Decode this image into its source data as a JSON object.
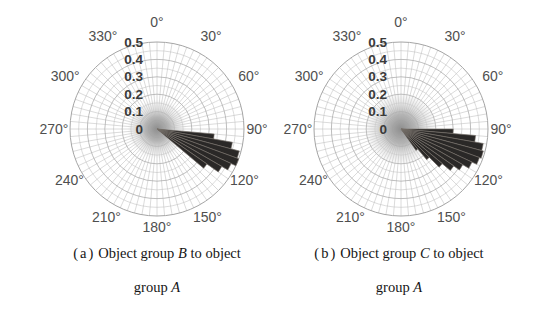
{
  "style": {
    "background": "#ffffff",
    "grid_color_minor": "#bfbfbf",
    "grid_color_major": "#adadad",
    "outer_ring_color": "#a5a5a5",
    "spoke_color": "#bdbdbd",
    "petal_fill": "#2a2827",
    "petal_stroke": "#7a746d",
    "blob_core_color": "#8d8d8d",
    "blob_mid_color": "#a8a8a8",
    "blob_edge_color": "#cfcfcf",
    "angle_label_color": "#4f4f4f",
    "radial_label_color": "#3a3a3a",
    "caption_color": "#151515"
  },
  "captions": {
    "a": {
      "tag": "(a)",
      "line1_pre": "Object group ",
      "line1_group": "B",
      "line1_post": " to object",
      "line2_pre": "group ",
      "line2_group": "A"
    },
    "b": {
      "tag": "(b)",
      "line1_pre": "Object group ",
      "line1_group": "C",
      "line1_post": " to object",
      "line2_pre": "group ",
      "line2_group": "A"
    }
  },
  "chart_data": [
    {
      "type": "rose",
      "title": "(a) Object group B to object group A",
      "rlim": [
        0,
        0.5
      ],
      "ring_step": 0.05,
      "major_ring_step": 0.1,
      "spoke_step_deg": 5,
      "grid": true,
      "angle_labels": [
        "0°",
        "30°",
        "60°",
        "90°",
        "120°",
        "150°",
        "180°",
        "210°",
        "240°",
        "270°",
        "300°",
        "330°"
      ],
      "angle_label_step_deg": 30,
      "radial_ticks": [
        0,
        0.1,
        0.2,
        0.3,
        0.4,
        0.5
      ],
      "radial_tick_labels": [
        "0",
        "0.1",
        "0.2",
        "0.3",
        "0.4",
        "0.5"
      ],
      "petal_width_deg": 5,
      "petals": [
        {
          "angle_deg": 97.5,
          "value": 0.33
        },
        {
          "angle_deg": 102.5,
          "value": 0.44
        },
        {
          "angle_deg": 107.5,
          "value": 0.49
        },
        {
          "angle_deg": 112.5,
          "value": 0.5
        },
        {
          "angle_deg": 117.5,
          "value": 0.47
        },
        {
          "angle_deg": 122.5,
          "value": 0.43
        },
        {
          "angle_deg": 127.5,
          "value": 0.35
        }
      ],
      "center_blob_radius": 0.17
    },
    {
      "type": "rose",
      "title": "(b) Object group C to object group A",
      "rlim": [
        0,
        0.5
      ],
      "ring_step": 0.05,
      "major_ring_step": 0.1,
      "spoke_step_deg": 5,
      "grid": true,
      "angle_labels": [
        "0°",
        "30°",
        "60°",
        "90°",
        "120°",
        "150°",
        "180°",
        "210°",
        "240°",
        "270°",
        "300°",
        "330°"
      ],
      "angle_label_step_deg": 30,
      "radial_ticks": [
        0,
        0.1,
        0.2,
        0.3,
        0.4,
        0.5
      ],
      "radial_tick_labels": [
        "0",
        "0.1",
        "0.2",
        "0.3",
        "0.4",
        "0.5"
      ],
      "petal_width_deg": 5,
      "petals": [
        {
          "angle_deg": 92.5,
          "value": 0.3
        },
        {
          "angle_deg": 97.5,
          "value": 0.43
        },
        {
          "angle_deg": 102.5,
          "value": 0.48
        },
        {
          "angle_deg": 107.5,
          "value": 0.49
        },
        {
          "angle_deg": 112.5,
          "value": 0.48
        },
        {
          "angle_deg": 117.5,
          "value": 0.45
        },
        {
          "angle_deg": 122.5,
          "value": 0.41
        },
        {
          "angle_deg": 127.5,
          "value": 0.37
        },
        {
          "angle_deg": 132.5,
          "value": 0.31
        },
        {
          "angle_deg": 137.5,
          "value": 0.23
        },
        {
          "angle_deg": 142.5,
          "value": 0.15
        }
      ],
      "center_blob_radius": 0.21
    }
  ]
}
